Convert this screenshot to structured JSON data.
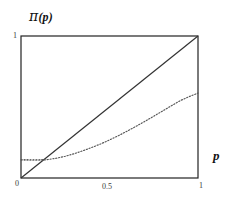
{
  "figure": {
    "title": "",
    "y_axis_label": "π (p)",
    "y_axis_label_symbol": "π",
    "y_axis_label_arg": "(p)",
    "x_axis_label": "p",
    "background_color": "#ffffff",
    "frame_color": "#222222",
    "identity_line_color": "#333333",
    "curve_color": "#555555"
  },
  "ticks": {
    "y_top": "1",
    "x_zero": "0",
    "x_mid": "0.5",
    "x_one": "1"
  },
  "chart_data": {
    "type": "line",
    "title": "",
    "xlabel": "p",
    "ylabel": "π (p)",
    "xlim": [
      0,
      1
    ],
    "ylim": [
      0,
      1
    ],
    "xticks": [
      0,
      0.5,
      1
    ],
    "xticklabels": [
      "0",
      "0.5",
      "1"
    ],
    "yticks": [
      0,
      1
    ],
    "yticklabels": [
      "0",
      "1"
    ],
    "grid": false,
    "legend": null,
    "frame": "box",
    "series": [
      {
        "name": "identity",
        "style": "solid",
        "color": "#333333",
        "x": [
          0,
          1
        ],
        "values": [
          0,
          1
        ]
      },
      {
        "name": "probability weighting function",
        "style": "dotted",
        "color": "#555555",
        "x": [
          0.0,
          0.05,
          0.1,
          0.14,
          0.2,
          0.25,
          0.3,
          0.35,
          0.4,
          0.45,
          0.5,
          0.55,
          0.6,
          0.65,
          0.7,
          0.75,
          0.8,
          0.85,
          0.9,
          0.95,
          1.0
        ],
        "values": [
          0.128,
          0.127,
          0.127,
          0.128,
          0.139,
          0.153,
          0.171,
          0.192,
          0.215,
          0.24,
          0.268,
          0.298,
          0.33,
          0.364,
          0.399,
          0.435,
          0.472,
          0.509,
          0.545,
          0.573,
          0.598
        ]
      }
    ],
    "annotations": [
      {
        "name": "intercept-dotted-guide",
        "style": "dotted-horizontal",
        "y": 0.128,
        "x_from": 0.0,
        "x_to": 0.135
      }
    ]
  }
}
